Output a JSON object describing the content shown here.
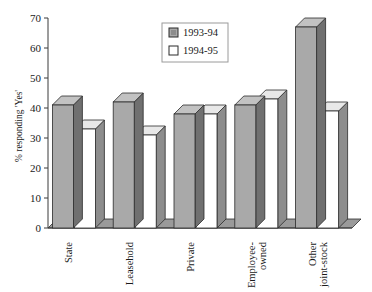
{
  "chart_data": {
    "type": "bar",
    "title": "",
    "xlabel": "",
    "ylabel": "% responding 'Yes'",
    "ylim": [
      0,
      70
    ],
    "ytick_step": 10,
    "yticks": [
      "0",
      "10",
      "20",
      "30",
      "40",
      "50",
      "60",
      "70"
    ],
    "grid": false,
    "legend_position": "top-center",
    "style": "3d-column",
    "categories": [
      "State",
      "Leasehold",
      "Private",
      "Employee-\nowned",
      "Other\njoint-stock"
    ],
    "category_lines": [
      [
        "State"
      ],
      [
        "Leasehold"
      ],
      [
        "Private"
      ],
      [
        "Employee-",
        "owned"
      ],
      [
        "Other",
        "joint-stock"
      ]
    ],
    "series": [
      {
        "name": "1993-94",
        "color": "#a9a9a9",
        "values": [
          41,
          42,
          38,
          41,
          67
        ]
      },
      {
        "name": "1994-95",
        "color": "#ffffff",
        "values": [
          33,
          31,
          38,
          43,
          39
        ]
      }
    ]
  },
  "legend": {
    "items": [
      {
        "label": "1993-94",
        "swatch": "#a9a9a9"
      },
      {
        "label": "1994-95",
        "swatch": "#ffffff"
      }
    ]
  },
  "colors": {
    "bar_gray_front": "#a9a9a9",
    "bar_gray_top": "#c2c2c2",
    "bar_gray_side": "#707070",
    "bar_white_front": "#ffffff",
    "bar_white_top": "#e8e8e8",
    "bar_white_side": "#8d8d8d",
    "floor": "#9a9a9a",
    "axis": "#3a3a3a",
    "outline": "#2b2b2b",
    "background": "#ffffff"
  }
}
